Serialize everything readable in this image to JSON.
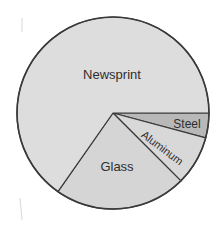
{
  "chart_data": {
    "type": "pie",
    "title": "",
    "start_angle_deg": 0,
    "direction": "clockwise",
    "categories": [
      "Steel",
      "Aluminum",
      "Glass",
      "Newsprint"
    ],
    "values": [
      4,
      8,
      23,
      65
    ],
    "unit": "percent (estimated from slice angles)",
    "angles_deg": [
      15,
      30,
      80,
      235
    ],
    "colors": [
      "#b8b8b8",
      "#d8d8d8",
      "#d5d5d5",
      "#dddddd"
    ],
    "labels": [
      {
        "text": "Steel",
        "x": 187,
        "y": 128,
        "rotate": 0,
        "size": 12
      },
      {
        "text": "Aluminum",
        "x": 160,
        "y": 151,
        "rotate": 37,
        "size": 11
      },
      {
        "text": "Glass",
        "x": 117,
        "y": 171,
        "rotate": 0,
        "size": 13
      },
      {
        "text": "Newsprint",
        "x": 112,
        "y": 79,
        "rotate": 0,
        "size": 13
      }
    ],
    "legend": "none (labels inside slices)",
    "center": [
      113,
      113
    ],
    "radius": 96
  }
}
